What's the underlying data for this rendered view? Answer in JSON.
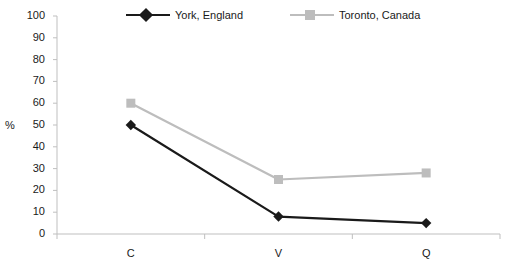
{
  "chart_data": {
    "type": "line",
    "title": "",
    "xlabel": "",
    "ylabel": "%",
    "categories": [
      "C",
      "V",
      "Q"
    ],
    "ylim": [
      0,
      100
    ],
    "ytick_values": [
      0,
      10,
      20,
      30,
      40,
      50,
      60,
      70,
      80,
      90,
      100
    ],
    "ytick_labels": [
      "0",
      "10",
      "20",
      "30",
      "40",
      "50",
      "60",
      "70",
      "80",
      "90",
      "100"
    ],
    "grid": false,
    "legend_position": "top",
    "series": [
      {
        "name": "York, England",
        "values": [
          50,
          8,
          5
        ],
        "color": "#1a1a1a",
        "marker": "diamond"
      },
      {
        "name": "Toronto, Canada",
        "values": [
          60,
          25,
          28
        ],
        "color": "#bdbdbd",
        "marker": "square"
      }
    ],
    "axis_color": "#bfbfbf"
  }
}
